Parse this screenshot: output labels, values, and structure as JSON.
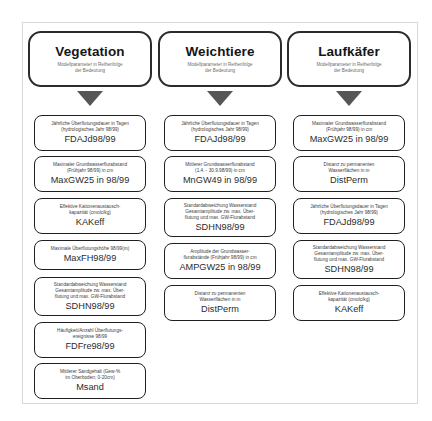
{
  "diagram": {
    "subtitle_text": "Modellparameter in Reihenfolge der Bedeutung",
    "columns": [
      {
        "id": "vegetation",
        "title": "Vegetation",
        "subtitle_line1": "Modellparameter in Reihenfolge",
        "subtitle_line2": "der Bedeutung",
        "items": [
          {
            "desc_line1": "Jährliche Überflutungsdauer in Tagen",
            "desc_line2": "(hydrologisches Jahr 98/99)",
            "desc_line3": "",
            "code": "FDAJd98/99"
          },
          {
            "desc_line1": "Maximaler Grundwasserflurabstand",
            "desc_line2": "(Frühjahr 98/99) in cm",
            "desc_line3": "",
            "code": "MaxGW25 in 98/99"
          },
          {
            "desc_line1": "Effektive Kationenaustausch-",
            "desc_line2": "kapazität (cmolc/kg)",
            "desc_line3": "",
            "code": "KAKeff"
          },
          {
            "desc_line1": "Maximale Überflutungshöhe 98/99(m)",
            "desc_line2": "",
            "desc_line3": "",
            "code": "MaxFH98/99"
          },
          {
            "desc_line1": "Standardabweichung Wasserstand",
            "desc_line2": "Gesamtamplitude zw. max. Über-",
            "desc_line3": "flutung und max. GW-Flurabstand",
            "code": "SDHN98/99"
          },
          {
            "desc_line1": "Häufigkeit/Anzahl Überflutungs-",
            "desc_line2": "ereignisse 98/99",
            "desc_line3": "",
            "code": "FDFre98/99"
          },
          {
            "desc_line1": "Mittlerer Sandgehalt (Gew-%",
            "desc_line2": "im Oberboden; 0-20cm)",
            "desc_line3": "",
            "code": "Msand"
          }
        ]
      },
      {
        "id": "weichtiere",
        "title": "Weichtiere",
        "subtitle_line1": "Modellparameter in Reihenfolge",
        "subtitle_line2": "der Bedeutung",
        "items": [
          {
            "desc_line1": "Jährliche Überflutungsdauer in Tagen",
            "desc_line2": "(hydrologisches Jahr 98/99)",
            "desc_line3": "",
            "code": "FDAJd98/99"
          },
          {
            "desc_line1": "Mittlerer Grundwasserflurabstand",
            "desc_line2": "(1.4. - 30.9.98/99) in cm",
            "desc_line3": "",
            "code": "MnGW49 in 98/99"
          },
          {
            "desc_line1": "Standardabweichung Wasserstand",
            "desc_line2": "Gesamtamplitude zw. max. Über-",
            "desc_line3": "flutung und max. GW-Flurabstand",
            "code": "SDHN98/99"
          },
          {
            "desc_line1": "Amplitude der Grundwasser-",
            "desc_line2": "flurabstände (Frühjahr 98/99) in cm",
            "desc_line3": "",
            "code": "AMPGW25 in 98/99"
          },
          {
            "desc_line1": "Distanz zu permanenten",
            "desc_line2": "Wasserflächen in m",
            "desc_line3": "",
            "code": "DistPerm"
          }
        ]
      },
      {
        "id": "laufkaefer",
        "title": "Laufkäfer",
        "subtitle_line1": "Modellparameter in Reihenfolge",
        "subtitle_line2": "der Bedeutung",
        "items": [
          {
            "desc_line1": "Maximaler Grundwasserflurabstand",
            "desc_line2": "(Frühjahr 98/99) in cm",
            "desc_line3": "",
            "code": "MaxGW25 in 98/99"
          },
          {
            "desc_line1": "Distanz zu permanenten",
            "desc_line2": "Wasserflächen in m",
            "desc_line3": "",
            "code": "DistPerm"
          },
          {
            "desc_line1": "Jährliche Überflutungsdauer in Tagen",
            "desc_line2": "(hydrologisches Jahr 98/99)",
            "desc_line3": "",
            "code": "FDAJd98/99"
          },
          {
            "desc_line1": "Standardabweichung Wasserstand",
            "desc_line2": "Gesamtamplitude zw. max. Über-",
            "desc_line3": "flutung und max. GW-Flurabstand",
            "code": "SDHN98/99"
          },
          {
            "desc_line1": "Effektive Kationenaustausch-",
            "desc_line2": "kapazität (cmolc/kg)",
            "desc_line3": "",
            "code": "KAKeff"
          }
        ]
      }
    ]
  },
  "colors": {
    "box_border": "#1f1f1f",
    "header_border": "#2b2b2b",
    "arrow_fill": "#565656",
    "frame_border": "#d8d8d8",
    "background": "#ffffff"
  }
}
